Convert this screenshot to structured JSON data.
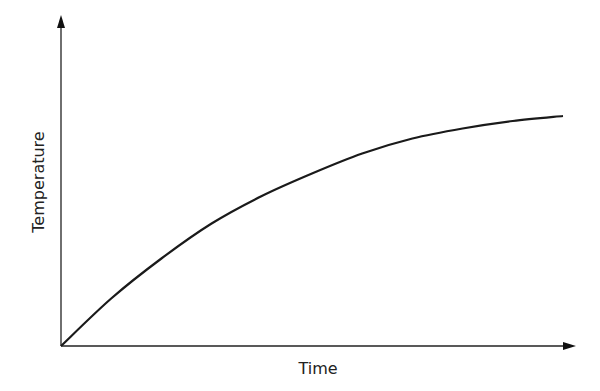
{
  "chart_data": {
    "type": "line",
    "title": "",
    "xlabel": "Time",
    "ylabel": "Temperature",
    "grid": false,
    "legend": null,
    "ticks": false,
    "x": [
      0,
      0.1,
      0.2,
      0.3,
      0.4,
      0.5,
      0.6,
      0.7,
      0.8,
      0.9,
      1.0
    ],
    "values": [
      0,
      0.19,
      0.35,
      0.49,
      0.6,
      0.69,
      0.77,
      0.83,
      0.87,
      0.9,
      0.92
    ],
    "xlim": [
      0,
      1
    ],
    "ylim": [
      0,
      1
    ]
  },
  "axes": {
    "x_label": "Time",
    "y_label": "Temperature"
  }
}
